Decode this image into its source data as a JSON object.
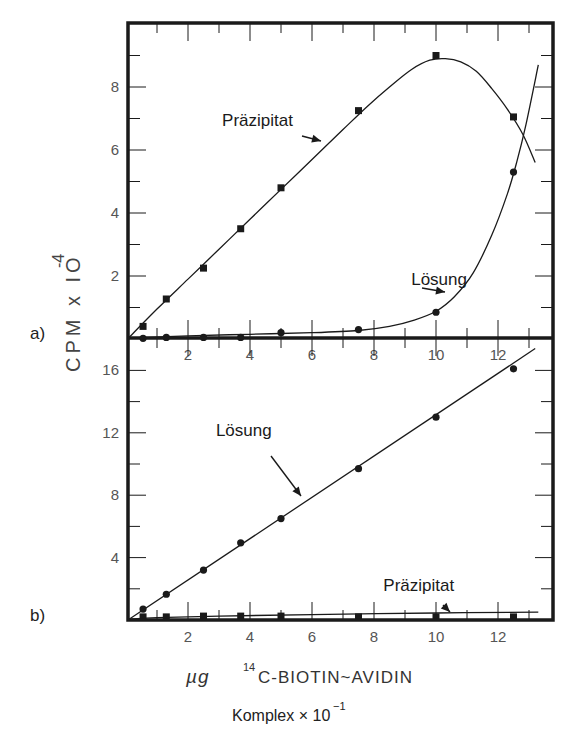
{
  "chart_data": [
    {
      "panel": "a)",
      "type": "line",
      "title": "",
      "xlabel": "µg 14C-BIOTIN~AVIDIN Komplex × 10^-1",
      "ylabel": "CPM × 10^-4",
      "xlim": [
        0,
        13.7
      ],
      "ylim": [
        0,
        10.2
      ],
      "xticks": [
        2,
        4,
        6,
        8,
        10,
        12
      ],
      "yticks": [
        2,
        4,
        6,
        8
      ],
      "grid": false,
      "series": [
        {
          "name": "Präzipitat",
          "marker": "square",
          "x": [
            0.55,
            1.3,
            2.5,
            3.7,
            5.0,
            7.5,
            10.0,
            12.5
          ],
          "values": [
            0.4,
            1.27,
            2.25,
            3.5,
            4.8,
            7.25,
            9.0,
            7.05
          ],
          "curve": [
            [
              0.1,
              0.05
            ],
            [
              1,
              0.95
            ],
            [
              2,
              1.9
            ],
            [
              3,
              2.85
            ],
            [
              4,
              3.8
            ],
            [
              5,
              4.75
            ],
            [
              6,
              5.7
            ],
            [
              7,
              6.65
            ],
            [
              7.8,
              7.4
            ],
            [
              8.5,
              8.0
            ],
            [
              9.2,
              8.55
            ],
            [
              9.8,
              8.85
            ],
            [
              10.3,
              8.9
            ],
            [
              10.8,
              8.8
            ],
            [
              11.3,
              8.5
            ],
            [
              11.8,
              7.95
            ],
            [
              12.3,
              7.3
            ],
            [
              12.8,
              6.5
            ],
            [
              13.2,
              5.6
            ]
          ],
          "annotation": {
            "text": "Präzipitat",
            "x": 3.1,
            "y": 6.75
          }
        },
        {
          "name": "Lösung",
          "marker": "circle",
          "x": [
            0.55,
            1.3,
            2.5,
            3.7,
            5.0,
            7.5,
            10.0,
            12.5
          ],
          "values": [
            0.02,
            0.05,
            0.05,
            0.05,
            0.2,
            0.3,
            0.85,
            5.3
          ],
          "curve": [
            [
              0.1,
              0.02
            ],
            [
              2,
              0.1
            ],
            [
              4,
              0.15
            ],
            [
              6,
              0.2
            ],
            [
              7.5,
              0.27
            ],
            [
              8.5,
              0.4
            ],
            [
              9.3,
              0.6
            ],
            [
              10,
              0.88
            ],
            [
              10.6,
              1.35
            ],
            [
              11.2,
              2.1
            ],
            [
              11.8,
              3.3
            ],
            [
              12.3,
              4.6
            ],
            [
              12.6,
              5.6
            ],
            [
              12.9,
              6.8
            ],
            [
              13.3,
              8.7
            ]
          ],
          "annotation": {
            "text": "Lösung",
            "x": 9.2,
            "y": 1.7
          }
        }
      ]
    },
    {
      "panel": "b)",
      "type": "line",
      "title": "",
      "xlabel": "µg 14C-BIOTIN~AVIDIN Komplex × 10^-1",
      "ylabel": "CPM × 10^-4",
      "xlim": [
        0,
        13.7
      ],
      "ylim": [
        0,
        17.9
      ],
      "xticks": [
        2,
        4,
        6,
        8,
        10,
        12
      ],
      "yticks": [
        4,
        8,
        12,
        16
      ],
      "grid": false,
      "series": [
        {
          "name": "Lösung",
          "marker": "circle",
          "x": [
            0.55,
            1.3,
            2.5,
            3.7,
            5.0,
            7.5,
            10.0,
            12.5
          ],
          "values": [
            0.7,
            1.65,
            3.2,
            4.95,
            6.5,
            9.7,
            13.0,
            16.1
          ],
          "curve": [
            [
              0.1,
              0.05
            ],
            [
              13.2,
              17.4
            ]
          ],
          "annotation": {
            "text": "Lösung",
            "x": 2.9,
            "y": 11.8
          }
        },
        {
          "name": "Präzipitat",
          "marker": "square",
          "x": [
            0.55,
            1.3,
            2.5,
            3.7,
            5.0,
            7.5,
            10.0,
            12.5
          ],
          "values": [
            0.2,
            0.2,
            0.25,
            0.25,
            0.25,
            0.2,
            0.2,
            0.2
          ],
          "curve": [
            [
              0.1,
              0.05
            ],
            [
              1,
              0.15
            ],
            [
              3,
              0.25
            ],
            [
              6,
              0.35
            ],
            [
              10,
              0.45
            ],
            [
              13.3,
              0.5
            ]
          ],
          "annotation": {
            "text": "Präzipitat",
            "x": 8.3,
            "y": 1.85
          }
        }
      ]
    }
  ],
  "labels": {
    "panel_a": "a)",
    "panel_b": "b)",
    "y_axis_main": "CPM x IO",
    "y_axis_exponent": "-4",
    "x_axis_line1_prefix": "µg",
    "x_axis_line1_super": "14",
    "x_axis_line1_main": "C-BIOTIN~AVIDIN",
    "x_axis_line2_main": "Komplex × 10",
    "x_axis_line2_exponent": "−1"
  },
  "colors": {
    "ink": "#1a1a1a",
    "tick_text": "#555555",
    "background": "#ffffff"
  }
}
